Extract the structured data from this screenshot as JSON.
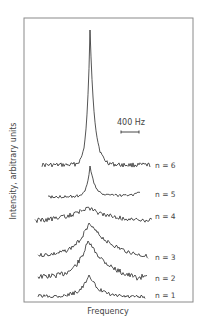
{
  "chart_data": {
    "type": "line",
    "title": "",
    "xlabel": "Frequency",
    "ylabel": "Intensity, arbitrary units",
    "grid": false,
    "legend": "none",
    "scale_bar": {
      "label": "400 Hz"
    },
    "series": [
      {
        "name": "n = 6",
        "label": "n = 6",
        "x_start": 42,
        "x_end": 150,
        "baseline_left": 165,
        "baseline_right": 165,
        "peak_x": 90,
        "peak_y": 30,
        "peak_width": 3,
        "tail": 1.5,
        "noise": 2.2,
        "seed": 6,
        "label_y": 168
      },
      {
        "name": "n = 5",
        "label": "n = 5",
        "x_start": 48,
        "x_end": 140,
        "baseline_left": 197,
        "baseline_right": 195,
        "peak_x": 90,
        "peak_y": 166,
        "peak_width": 3,
        "tail": 1.6,
        "noise": 1.4,
        "seed": 5,
        "end_rise": 4,
        "label_y": 197
      },
      {
        "name": "n = 4",
        "label": "n = 4",
        "x_start": 35,
        "x_end": 152,
        "baseline_left": 222,
        "baseline_right": 221,
        "peak_x": 88,
        "peak_y": 207,
        "peak_width": 22,
        "tail": 1.0,
        "noise": 2.2,
        "seed": 4,
        "label_y": 219
      },
      {
        "name": "n = 3",
        "label": "n = 3",
        "x_start": 38,
        "x_end": 148,
        "baseline_left": 256,
        "baseline_right": 260,
        "peak_x": 89,
        "peak_y": 223,
        "peak_width": 14,
        "tail": 1.8,
        "noise": 2.0,
        "seed": 3,
        "label_y": 260
      },
      {
        "name": "n = 2",
        "label": "n = 2",
        "x_start": 38,
        "x_end": 147,
        "baseline_left": 277,
        "baseline_right": 283,
        "peak_x": 88,
        "peak_y": 241,
        "peak_width": 12,
        "tail": 1.9,
        "noise": 2.6,
        "seed": 2,
        "end_rise": 6,
        "label_y": 281
      },
      {
        "name": "n = 1",
        "label": "n = 1",
        "x_start": 38,
        "x_end": 145,
        "baseline_left": 296,
        "baseline_right": 297,
        "peak_x": 89,
        "peak_y": 275,
        "peak_width": 8,
        "tail": 1.2,
        "noise": 2.0,
        "seed": 1,
        "label_y": 298
      }
    ],
    "layout": {
      "frame": {
        "x": 24,
        "y": 18,
        "w": 169,
        "h": 284
      },
      "n_label_x": 155,
      "scale_text": {
        "x": 117,
        "y": 125
      },
      "scale_bar": {
        "x1": 121,
        "x2": 139,
        "y": 132
      },
      "xlabel_pos": {
        "x": 108,
        "y": 314
      },
      "ylabel_pos": {
        "x": 16,
        "y": 171
      }
    }
  }
}
